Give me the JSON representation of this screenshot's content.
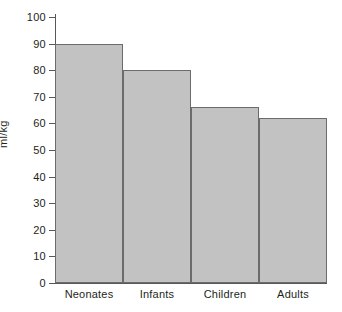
{
  "chart_data": {
    "type": "bar",
    "title": "",
    "xlabel": "",
    "ylabel": "ml/kg",
    "categories": [
      "Neonates",
      "Infants",
      "Children",
      "Adults"
    ],
    "values": [
      90,
      80,
      66,
      62
    ],
    "ylim": [
      0,
      100
    ],
    "yticks": [
      0,
      10,
      20,
      30,
      40,
      50,
      60,
      70,
      80,
      90,
      100
    ],
    "ytick_labels": [
      "0",
      "10",
      "20",
      "30",
      "40",
      "50",
      "60",
      "70",
      "80",
      "90",
      "100"
    ],
    "grid": false,
    "legend": false,
    "bar_gap": 0,
    "colors": {
      "bar_fill": "#c2c2c2",
      "bar_border": "#6b6b6d",
      "axis": "#58585a",
      "text": "#231f20",
      "background": "#ffffff"
    }
  }
}
